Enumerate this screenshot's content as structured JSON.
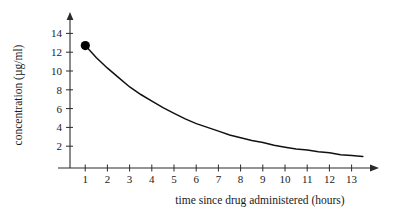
{
  "chart_data": {
    "type": "line",
    "title": "",
    "subtitle": "",
    "xlabel": "time since drug administered (hours)",
    "ylabel": "concentration (µg/ml)",
    "xlim": [
      0,
      14
    ],
    "ylim": [
      0,
      15
    ],
    "grid": false,
    "legend": null,
    "x_ticks": [
      1,
      2,
      3,
      4,
      5,
      6,
      7,
      8,
      9,
      10,
      11,
      12,
      13
    ],
    "x_tick_labels": [
      "1",
      "2",
      "3",
      "4",
      "5",
      "6",
      "7",
      "8",
      "9",
      "10",
      "11",
      "12",
      "13"
    ],
    "y_ticks": [
      2,
      4,
      6,
      8,
      10,
      12,
      14
    ],
    "y_tick_labels": [
      "2",
      "4",
      "6",
      "8",
      "10",
      "12",
      "14"
    ],
    "series": [
      {
        "name": "drug concentration",
        "x": [
          1.5,
          2,
          2.5,
          3,
          3.5,
          4,
          4.5,
          5,
          5.5,
          6,
          6.5,
          7,
          7.5,
          8,
          8.5,
          9,
          9.5,
          10,
          10.5,
          11,
          11.5,
          12,
          12.5,
          13,
          13.5,
          14
        ],
        "values": [
          12.7,
          11.4,
          10.3,
          9.3,
          8.3,
          7.5,
          6.8,
          6.1,
          5.5,
          4.9,
          4.4,
          4.0,
          3.6,
          3.2,
          2.9,
          2.6,
          2.4,
          2.1,
          1.9,
          1.7,
          1.6,
          1.4,
          1.3,
          1.1,
          1.0,
          0.9
        ]
      }
    ],
    "marked_points": [
      {
        "label": "",
        "x": 1.5,
        "y": 12.7
      }
    ],
    "annotations": []
  },
  "axes": {
    "x_axis_name": "horizontal-axis",
    "y_axis_name": "vertical-axis",
    "x_arrow": true,
    "y_arrow": true
  },
  "colors": {
    "curve": "#111111",
    "axis": "#2b2b2b",
    "marker": "#000000",
    "text": "#1a1a1a",
    "background": "#ffffff"
  }
}
